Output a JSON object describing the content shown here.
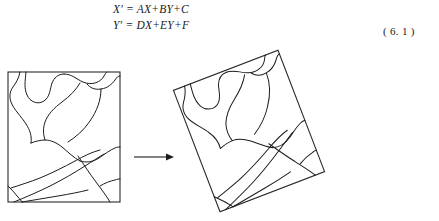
{
  "document": {
    "equations": [
      {
        "id": "eq-x",
        "text": "X′ = AX+BY+C"
      },
      {
        "id": "eq-y",
        "text": "Y′ = DX+EY+F"
      }
    ],
    "equation_number": "( 6. 1 )"
  },
  "figure": {
    "left_panel": {
      "name": "source-map-square",
      "description": "square map outline with region boundary curves"
    },
    "right_panel": {
      "name": "transformed-map-quad",
      "description": "rotated square map outline with region boundary curves"
    },
    "arrow": {
      "name": "transform-arrow",
      "direction": "right"
    }
  },
  "colors": {
    "ink": "#1c1c1c",
    "frame": "#2a2a2a",
    "paper": "#ffffff"
  },
  "geometry": {
    "source_square": {
      "x": 8,
      "y": 24,
      "width": 112,
      "height": 130
    },
    "target_quad": {
      "points": "180,49 290,7 318,115 200,159"
    },
    "arrow_line": {
      "x1": 134,
      "y1": 109,
      "x2": 168,
      "y2": 109
    }
  }
}
